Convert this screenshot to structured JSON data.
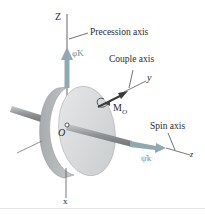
{
  "diagram": {
    "axes": {
      "Z": "Z",
      "y": "y",
      "z": "z",
      "x": "x"
    },
    "origin_label": "O",
    "labels": {
      "precession_axis": "Precession axis",
      "couple_axis": "Couple axis",
      "spin_axis": "Spin axis"
    },
    "vectors": {
      "precession": "φ̇K",
      "spin": "ψ̇k",
      "moment": "M",
      "moment_subscript": "O"
    },
    "colors": {
      "axis_line": "#555555",
      "vector_fill": "#8fa9b0",
      "disk_face": "#d8dadb",
      "disk_rim": "#b2b5b7",
      "moment_vector": "#3a3a3a"
    }
  }
}
